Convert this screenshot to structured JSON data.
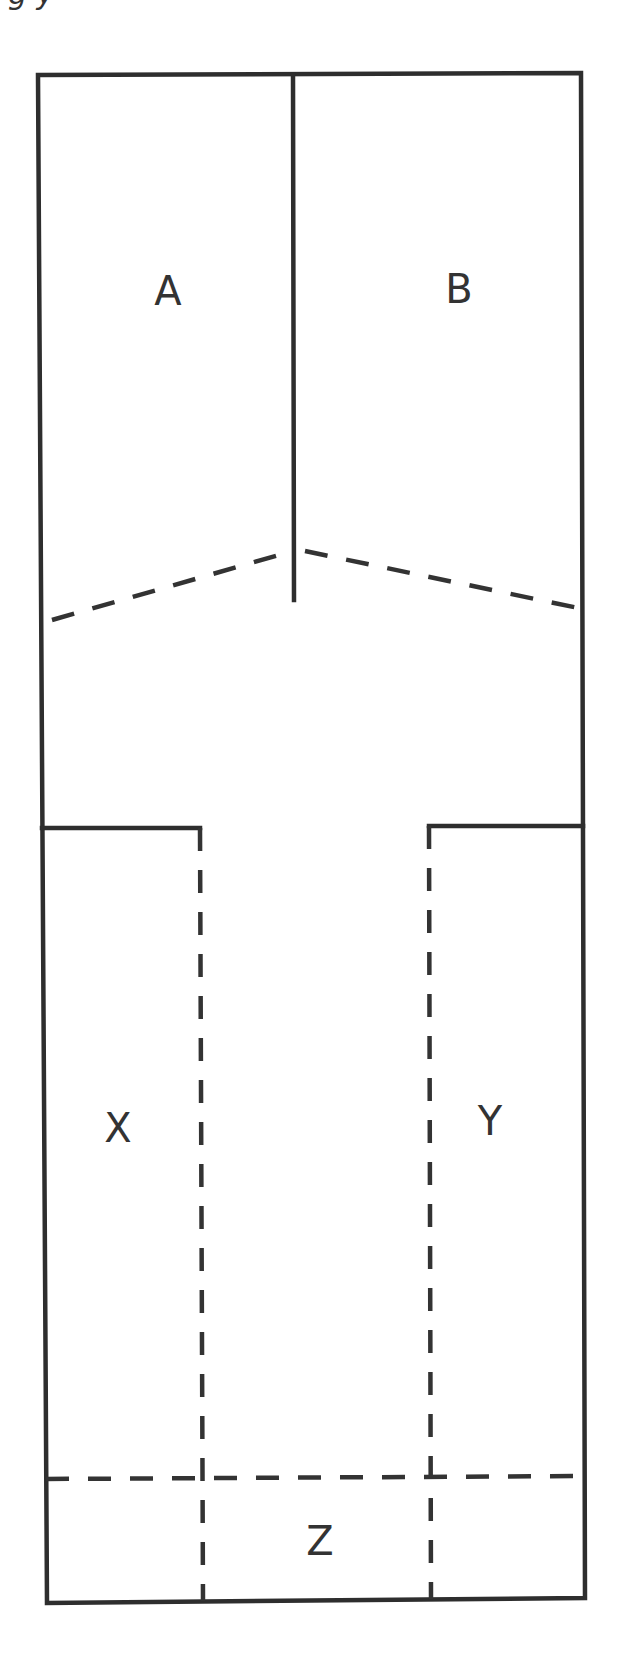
{
  "caption_fragment": "g y",
  "diagram": {
    "type": "region-partition-diagram",
    "stroke_color": "#333333",
    "background": "#ffffff",
    "regions": [
      {
        "id": "A",
        "label": "A",
        "position": "top-left"
      },
      {
        "id": "B",
        "label": "B",
        "position": "top-right"
      },
      {
        "id": "X",
        "label": "X",
        "position": "lower-left"
      },
      {
        "id": "Y",
        "label": "Y",
        "position": "lower-right"
      },
      {
        "id": "Z",
        "label": "Z",
        "position": "bottom-center"
      }
    ],
    "labels": {
      "a": "A",
      "b": "B",
      "x": "X",
      "y": "Y",
      "z": "Z"
    },
    "lines": {
      "solid": [
        "outer-border",
        "top-center-divider",
        "left-shoulder",
        "right-shoulder"
      ],
      "dashed": [
        "left-chevron",
        "right-chevron",
        "left-stem",
        "right-stem",
        "bottom-crossbar"
      ]
    }
  }
}
